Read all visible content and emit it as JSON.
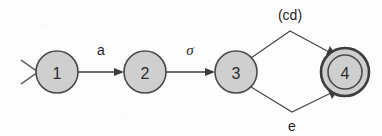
{
  "diagram": {
    "type": "finite-state-automaton",
    "title": "",
    "states": [
      {
        "id": "1",
        "label": "1",
        "cx": 57,
        "cy": 72,
        "r": 21,
        "accepting": false,
        "start": true
      },
      {
        "id": "2",
        "label": "2",
        "cx": 145,
        "cy": 72,
        "r": 21,
        "accepting": false,
        "start": false
      },
      {
        "id": "3",
        "label": "3",
        "cx": 236,
        "cy": 72,
        "r": 21,
        "accepting": false,
        "start": false
      },
      {
        "id": "4",
        "label": "4",
        "cx": 345,
        "cy": 72,
        "r": 24,
        "accepting": true,
        "start": false
      }
    ],
    "transitions": [
      {
        "from": "1",
        "to": "2",
        "label": "a",
        "label_x": 101,
        "label_y": 50
      },
      {
        "from": "2",
        "to": "3",
        "label": "σ",
        "label_x": 190,
        "label_y": 50
      },
      {
        "from": "3",
        "to": "4",
        "label": "(cd)",
        "label_x": 290,
        "label_y": 15
      },
      {
        "from": "3",
        "to": "4",
        "label": "e",
        "label_x": 292,
        "label_y": 126
      }
    ],
    "start_marker": "open-arrow-chevron",
    "colors": {
      "state_fill": "#cfcfcf",
      "state_stroke": "#4a4a4a",
      "edge_stroke": "#3a3a3a",
      "text": "#1f1f1f",
      "background": "#fdfdfd"
    }
  }
}
